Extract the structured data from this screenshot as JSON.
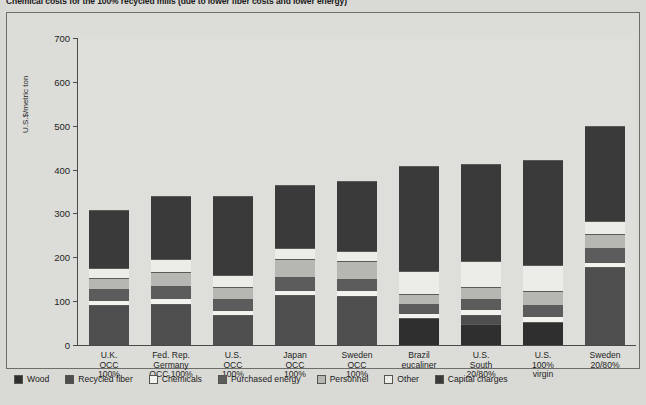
{
  "title": "Chemical costs for the 100% recycled mills (due to lower fiber costs and lower energy)",
  "chart_data": {
    "type": "bar",
    "subtype": "stacked-vertical",
    "title": "Chemical costs for the 100% recycled mills (due to lower fiber costs and lower energy)",
    "xlabel": "",
    "ylabel": "U.S.$/metric ton",
    "ylim": [
      0,
      700
    ],
    "ytick_step": 100,
    "yticks": [
      0,
      100,
      200,
      300,
      400,
      500,
      600,
      700
    ],
    "grid": false,
    "legend_position": "bottom",
    "categories": [
      "U.K.\nOCC\n100%",
      "Fed. Rep.\nGermany\nOCC 100%",
      "U.S.\nOCC\n100%",
      "Japan\nOCC\n100%",
      "Sweden\nOCC\n100%",
      "Brazil\neucaliner",
      "U.S.\nSouth\n20/80%",
      "U.S.\n100%\nvirgin",
      "Sweden\n20/80%"
    ],
    "series": [
      {
        "name": "Wood",
        "color": "#2f2f2f",
        "values": [
          0,
          0,
          0,
          0,
          0,
          60,
          45,
          50,
          0
        ]
      },
      {
        "name": "Recycled fiber",
        "color": "#4e4e4e",
        "values": [
          88,
          92,
          66,
          112,
          110,
          0,
          20,
          0,
          175
        ]
      },
      {
        "name": "Chemicals",
        "color": "#f2f2ee",
        "values": [
          10,
          10,
          10,
          10,
          10,
          8,
          10,
          12,
          10
        ]
      },
      {
        "name": "Purchased energy",
        "color": "#5c5c5c",
        "values": [
          22,
          26,
          22,
          26,
          24,
          18,
          20,
          22,
          30
        ]
      },
      {
        "name": "Personnel",
        "color": "#b6b6b2",
        "values": [
          24,
          30,
          26,
          38,
          38,
          22,
          26,
          30,
          30
        ]
      },
      {
        "name": "Other",
        "color": "#ececE8",
        "values": [
          20,
          26,
          24,
          24,
          22,
          50,
          56,
          56,
          26
        ]
      },
      {
        "name": "Capital charges",
        "color": "#3a3a3a",
        "values": [
          130,
          143,
          178,
          142,
          157,
          237,
          220,
          238,
          215
        ]
      }
    ],
    "totals": [
      294,
      327,
      326,
      352,
      361,
      395,
      397,
      408,
      486
    ],
    "legend": [
      {
        "label": "Wood",
        "color": "#2f2f2f"
      },
      {
        "label": "Recycled fiber",
        "color": "#4e4e4e"
      },
      {
        "label": "Chemicals",
        "color": "#f2f2ee"
      },
      {
        "label": "Purchased energy",
        "color": "#5c5c5c"
      },
      {
        "label": "Personnel",
        "color": "#b6b6b2"
      },
      {
        "label": "Other",
        "color": "#ececE8"
      },
      {
        "label": "Capital charges",
        "color": "#3a3a3a"
      }
    ]
  }
}
